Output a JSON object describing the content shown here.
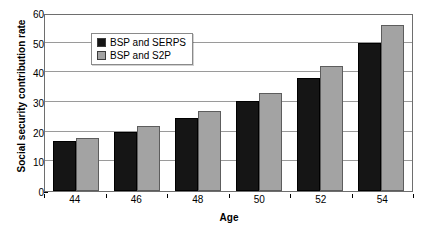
{
  "chart_data": {
    "type": "bar",
    "title": "",
    "xlabel": "Age",
    "ylabel": "Social security contribution rate",
    "categories": [
      "44",
      "46",
      "48",
      "50",
      "52",
      "54"
    ],
    "ylim": [
      0,
      60
    ],
    "yticks": [
      0,
      10,
      20,
      30,
      40,
      50,
      60
    ],
    "grid": true,
    "legend_position": "top-left",
    "series": [
      {
        "name": "BSP and SERPS",
        "color": "#151515",
        "values": [
          17,
          20,
          24.5,
          30.5,
          38,
          50
        ]
      },
      {
        "name": "BSP and S2P",
        "color": "#a3a3a3",
        "values": [
          18,
          22,
          27,
          33,
          42,
          56
        ]
      }
    ]
  }
}
